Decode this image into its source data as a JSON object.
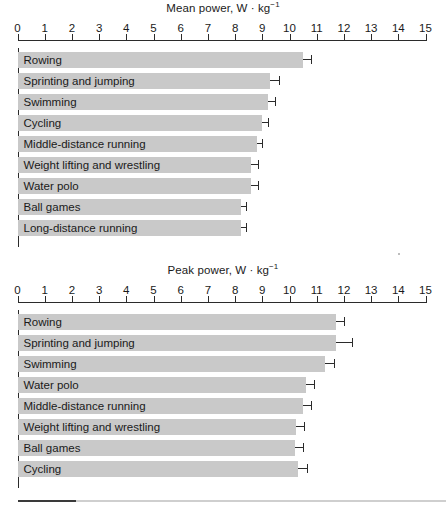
{
  "figure": {
    "width": 446,
    "height": 510,
    "background": "#ffffff",
    "bar_color": "#c9c9c9",
    "axis_color": "#2b2b2b",
    "text_color": "#1a1a1a",
    "footer_rule_dark_color": "#3a3a3a",
    "footer_rule_light_color": "#cfcfcf"
  },
  "chart_data": [
    {
      "type": "bar",
      "orientation": "horizontal",
      "title": "Mean power, W · kg−1",
      "title_main": "Mean power, W · kg",
      "title_exponent": "−1",
      "xlabel": "",
      "ylabel": "",
      "xlim": [
        0,
        15
      ],
      "xticks": [
        0,
        1,
        2,
        3,
        4,
        5,
        6,
        7,
        8,
        9,
        10,
        11,
        12,
        13,
        14,
        15
      ],
      "xticklabels": [
        "0",
        "1",
        "2",
        "3",
        "4",
        "5",
        "6",
        "7",
        "8",
        "9",
        "10",
        "11",
        "12",
        "13",
        "14",
        "15"
      ],
      "grid": false,
      "legend": "none",
      "errorbars": "upper only",
      "categories": [
        "Rowing",
        "Sprinting and jumping",
        "Swimming",
        "Cycling",
        "Middle-distance running",
        "Weight lifting and wrestling",
        "Water polo",
        "Ball games",
        "Long-distance running"
      ],
      "values": [
        10.5,
        9.3,
        9.2,
        9.0,
        8.8,
        8.6,
        8.6,
        8.2,
        8.2
      ],
      "errors": [
        0.3,
        0.3,
        0.25,
        0.2,
        0.2,
        0.25,
        0.25,
        0.2,
        0.2
      ]
    },
    {
      "type": "bar",
      "orientation": "horizontal",
      "title": "Peak power, W · kg−1",
      "title_main": "Peak power, W · kg",
      "title_exponent": "−1",
      "xlabel": "",
      "ylabel": "",
      "xlim": [
        0,
        15
      ],
      "xticks": [
        0,
        1,
        2,
        3,
        4,
        5,
        6,
        7,
        8,
        9,
        10,
        11,
        12,
        13,
        14,
        15
      ],
      "xticklabels": [
        "0",
        "1",
        "2",
        "3",
        "4",
        "5",
        "6",
        "7",
        "8",
        "9",
        "10",
        "11",
        "12",
        "13",
        "14",
        "15"
      ],
      "grid": false,
      "legend": "none",
      "errorbars": "upper only",
      "categories": [
        "Rowing",
        "Sprinting and jumping",
        "Swimming",
        "Water polo",
        "Middle-distance running",
        "Weight lifting and wrestling",
        "Ball games",
        "Cycling"
      ],
      "values": [
        11.7,
        11.7,
        11.3,
        10.6,
        10.5,
        10.25,
        10.2,
        10.3
      ],
      "errors": [
        0.3,
        0.6,
        0.35,
        0.3,
        0.3,
        0.3,
        0.3,
        0.35
      ]
    }
  ]
}
